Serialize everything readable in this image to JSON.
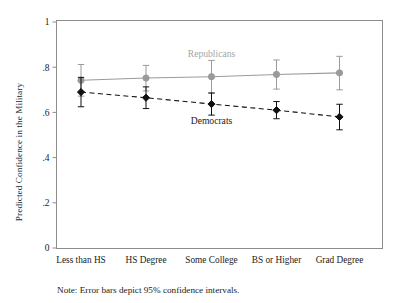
{
  "chart_data": {
    "type": "line",
    "title": "",
    "xlabel": "",
    "ylabel": "Predicted Confidence in the Military",
    "categories": [
      "Less than HS",
      "HS Degree",
      "Some College",
      "BS or Higher",
      "Grad Degree"
    ],
    "ylim": [
      0,
      1
    ],
    "yticks": [
      0,
      0.2,
      0.4,
      0.6,
      0.8,
      1
    ],
    "ytick_labels": [
      "0",
      ".2",
      ".4",
      ".6",
      ".8",
      "1"
    ],
    "grid": false,
    "legend_position": "inline-annotation",
    "series": [
      {
        "name": "Republicans",
        "color": "#9a9a9a",
        "linestyle": "solid",
        "marker": "circle",
        "values": [
          0.742,
          0.752,
          0.758,
          0.768,
          0.775
        ],
        "ci_lower": [
          0.672,
          0.695,
          0.685,
          0.703,
          0.7
        ],
        "ci_upper": [
          0.812,
          0.808,
          0.83,
          0.832,
          0.848
        ]
      },
      {
        "name": "Democrats",
        "color": "#111111",
        "linestyle": "dashed",
        "marker": "diamond",
        "values": [
          0.69,
          0.665,
          0.637,
          0.61,
          0.58
        ],
        "ci_lower": [
          0.625,
          0.617,
          0.588,
          0.572,
          0.523
        ],
        "ci_upper": [
          0.755,
          0.713,
          0.686,
          0.648,
          0.636
        ]
      }
    ],
    "annotations": [
      {
        "text": "Republicans",
        "x_category_index": 2,
        "y": 0.845,
        "color": "#a6a6a6"
      },
      {
        "text": "Democrats",
        "x_category_index": 2,
        "y": 0.548,
        "color": "#1a1a1a"
      }
    ],
    "note": "Note: Error bars depict 95% confidence intervals."
  }
}
